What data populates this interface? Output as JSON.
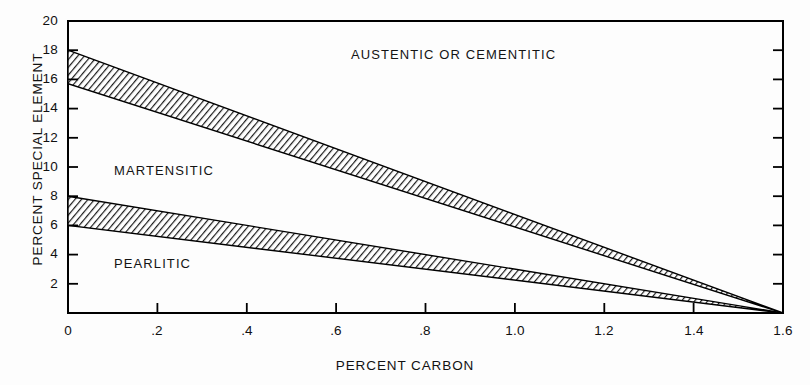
{
  "chart_data": {
    "type": "area",
    "title": "",
    "subtitle": "",
    "xlabel": "PERCENT CARBON",
    "ylabel": "PERCENT SPECIAL ELEMENT",
    "xlim": [
      0,
      1.6
    ],
    "ylim": [
      0,
      20
    ],
    "grid": false,
    "legend_position": "none",
    "xticks": [
      0,
      0.2,
      0.4,
      0.6,
      0.8,
      1.0,
      1.2,
      1.4,
      1.6
    ],
    "xtick_labels": [
      "0",
      ".2",
      ".4",
      ".6",
      ".8",
      "1.0",
      "1.2",
      "1.4",
      "1.6"
    ],
    "yticks": [
      2,
      4,
      6,
      8,
      10,
      12,
      14,
      16,
      18,
      20
    ],
    "ytick_labels": [
      "2",
      "4",
      "6",
      "8",
      "10",
      "12",
      "14",
      "16",
      "18",
      "20"
    ],
    "bands": [
      {
        "name": "martensite-austenite boundary band",
        "upper": {
          "x": [
            0,
            1.6
          ],
          "y": [
            18,
            0
          ]
        },
        "lower": {
          "x": [
            0,
            1.6
          ],
          "y": [
            15.7,
            0
          ]
        },
        "fill": "hatched"
      },
      {
        "name": "pearlite-martensite boundary band",
        "upper": {
          "x": [
            0,
            1.6
          ],
          "y": [
            8,
            0
          ]
        },
        "lower": {
          "x": [
            0,
            1.6
          ],
          "y": [
            6,
            0
          ]
        },
        "fill": "hatched"
      }
    ],
    "annotations": [
      {
        "text": "AUSTENTIC OR CEMENTITIC",
        "x": 0.83,
        "y": 17.0
      },
      {
        "text": "MARTENSITIC",
        "x": 0.16,
        "y": 10.2
      },
      {
        "text": "PEARLITIC",
        "x": 0.16,
        "y": 3.9
      }
    ]
  },
  "axes": {
    "x_title": "PERCENT CARBON",
    "y_title": "PERCENT SPECIAL ELEMENT",
    "x_tick_labels": [
      "0",
      ".2",
      ".4",
      ".6",
      ".8",
      "1.0",
      "1.2",
      "1.4",
      "1.6"
    ],
    "y_tick_labels": [
      "20",
      "18",
      "16",
      "14",
      "12",
      "10",
      "8",
      "6",
      "4",
      "2"
    ]
  },
  "regions": {
    "austentic": "AUSTENTIC OR CEMENTITIC",
    "martensitic": "MARTENSITIC",
    "pearlitic": "PEARLITIC"
  },
  "colors": {
    "ink": "#000000",
    "background": "#fdfdfd",
    "hatch": "#1a1a1a"
  }
}
